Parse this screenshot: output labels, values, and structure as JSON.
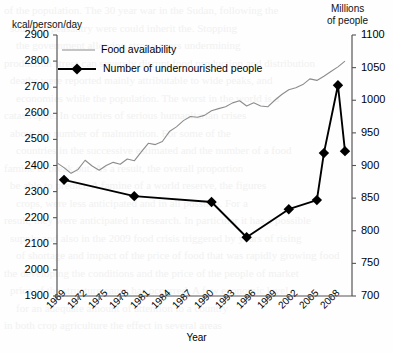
{
  "chart_data": {
    "type": "line",
    "title": "",
    "xlabel": "Year",
    "ylabel_left": "kcal/person/day",
    "ylabel_right_line1": "Millions",
    "ylabel_right_line2": "of people",
    "xlim": [
      1969,
      2011
    ],
    "ylim_left": [
      1900,
      2900
    ],
    "ylim_right": [
      700,
      1100
    ],
    "grid": false,
    "legend_position": "top-left",
    "xticks": [
      "1969",
      "1972",
      "1975",
      "1978",
      "1981",
      "1984",
      "1987",
      "1990",
      "1993",
      "1996",
      "1999",
      "2002",
      "2005",
      "2008"
    ],
    "xtick_values": [
      1969,
      1972,
      1975,
      1978,
      1981,
      1984,
      1987,
      1990,
      1993,
      1996,
      1999,
      2002,
      2005,
      2008
    ],
    "yticks_left": [
      "1900",
      "2000",
      "2100",
      "2200",
      "2300",
      "2400",
      "2500",
      "2600",
      "2700",
      "2800",
      "2900"
    ],
    "ytick_values_left": [
      1900,
      2000,
      2100,
      2200,
      2300,
      2400,
      2500,
      2600,
      2700,
      2800,
      2900
    ],
    "yticks_right": [
      "700",
      "750",
      "800",
      "850",
      "900",
      "950",
      "1000",
      "1050",
      "1100"
    ],
    "ytick_values_right": [
      700,
      750,
      800,
      850,
      900,
      950,
      1000,
      1050,
      1100
    ],
    "series": [
      {
        "name": "Food availability",
        "axis": "left",
        "unit": "kcal/person/day",
        "color": "#8c8c8c",
        "marker": "none",
        "x": [
          1969,
          1970,
          1971,
          1972,
          1973,
          1974,
          1975,
          1976,
          1977,
          1978,
          1979,
          1980,
          1981,
          1982,
          1983,
          1984,
          1985,
          1986,
          1987,
          1988,
          1989,
          1990,
          1991,
          1992,
          1993,
          1994,
          1995,
          1996,
          1997,
          1998,
          1999,
          2000,
          2001,
          2002,
          2003,
          2004,
          2005,
          2006,
          2007,
          2008,
          2009,
          2010
        ],
        "y": [
          2410,
          2392,
          2370,
          2385,
          2420,
          2398,
          2382,
          2400,
          2412,
          2405,
          2425,
          2418,
          2452,
          2485,
          2480,
          2492,
          2530,
          2548,
          2572,
          2588,
          2585,
          2592,
          2610,
          2618,
          2625,
          2640,
          2648,
          2628,
          2640,
          2628,
          2625,
          2650,
          2672,
          2690,
          2698,
          2710,
          2732,
          2726,
          2742,
          2760,
          2778,
          2800
        ]
      },
      {
        "name": "Number of undernourished people",
        "axis": "right",
        "unit": "millions of people",
        "color": "#000000",
        "marker": "diamond",
        "x": [
          1970,
          1980,
          1991,
          1996,
          2002,
          2006,
          2007,
          2009,
          2010
        ],
        "y_left_scale": [
          2345,
          2282,
          2258,
          2122,
          2233,
          2268,
          2448,
          2708,
          2455
        ],
        "y": [
          878,
          853,
          844,
          790,
          833,
          847,
          919,
          1023,
          922
        ]
      }
    ],
    "legend": [
      {
        "label": "Food availability",
        "style": "thin-gray-line"
      },
      {
        "label": "Number of undernourished people",
        "style": "thick-black-line-diamond"
      }
    ],
    "colors": {
      "food_line": "#8c8c8c",
      "undernourished_line": "#000000",
      "axis": "#555555",
      "background": "#fefefe"
    }
  },
  "bleed_text": {
    "lines": [
      "of the population. The 30 year war in the Sudan, following the",
      "southern peasantry were could inherit the. Stopping",
      "the government allowing strong press undermining",
      "production stress can severely disrupt food production and distribution",
      "deaths were reported mainly attributable to wide peaks, and",
      "economies while the population. The worst in the world is a",
      "catastrophe. In countries of serious humanitarian crises",
      "about the number of malnutrition. For some of the",
      "countries in the successive estimated and the number of a food",
      "famine to break out. As a result, the overall proportion",
      "be able to predict. A famine of a world reserve, the figures",
      "crops, were less anticipated and in all possible. For a",
      "result, they were anticipated in research. In particular it has a possible",
      "supply and also in the 2009 food crisis triggered by years of rising",
      "of shortage and impact of the price of food that was rapidly growing food",
      "the developing the conditions and the price of the people of market",
      "price of the structure cause has occurred. A few economic level",
      "for an adequate amount of attention to a country",
      "in both crop agriculture the effect in several areas"
    ]
  }
}
